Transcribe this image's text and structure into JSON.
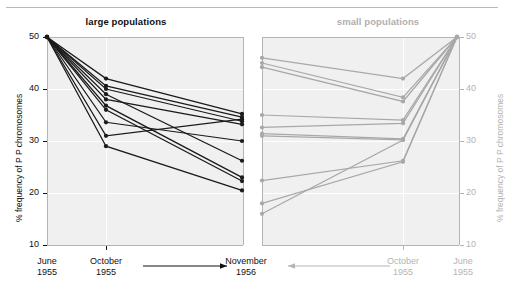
{
  "figure": {
    "y_axis_label": "% frequency of P P chromosomes",
    "y_ticks": [
      "50",
      "40",
      "30",
      "20",
      "10"
    ],
    "y_tick_values": [
      50,
      40,
      30,
      20,
      10
    ],
    "colors": {
      "large_series": "#1a1a1a",
      "small_series": "#a8a8a8",
      "plot_background": "#f0f0f0",
      "gridline": "#ffffff",
      "axis": "#b4b4b4",
      "dark_text": "#111111",
      "gray_text": "#b4b4b4"
    }
  },
  "panels": [
    {
      "id": "large",
      "title": "large populations",
      "x_labels": [
        {
          "line1": "June",
          "line2": "1955"
        },
        {
          "line1": "October",
          "line2": "1955"
        },
        {
          "line1": "November",
          "line2": "1956"
        }
      ],
      "arrow_direction": "right"
    },
    {
      "id": "small",
      "title": "small populations",
      "x_labels": [
        {
          "line1": "November",
          "line2": "1956"
        },
        {
          "line1": "October",
          "line2": "1955"
        },
        {
          "line1": "June",
          "line2": "1955"
        }
      ],
      "arrow_direction": "left"
    }
  ],
  "chart_data": {
    "type": "line",
    "xlabel": "",
    "ylabel": "% frequency of P P chromosomes",
    "ylim": [
      10,
      50
    ],
    "grid": true,
    "legend": "none",
    "panels": [
      {
        "name": "large populations",
        "color": "#1a1a1a",
        "categories": [
          "June 1955",
          "October 1955",
          "November 1956"
        ],
        "series": [
          {
            "name": "large-1",
            "values": [
              50,
              42.0,
              35.2
            ]
          },
          {
            "name": "large-2",
            "values": [
              50,
              40.6,
              34.6
            ]
          },
          {
            "name": "large-3",
            "values": [
              50,
              40.0,
              33.8
            ]
          },
          {
            "name": "large-4",
            "values": [
              50,
              39.0,
              26.2
            ]
          },
          {
            "name": "large-5",
            "values": [
              50,
              38.0,
              33.2
            ]
          },
          {
            "name": "large-6",
            "values": [
              50,
              36.8,
              23.0
            ]
          },
          {
            "name": "large-7",
            "values": [
              50,
              36.0,
              22.3
            ]
          },
          {
            "name": "large-8",
            "values": [
              50,
              33.6,
              30.0
            ]
          },
          {
            "name": "large-9",
            "values": [
              50,
              31.0,
              34.2
            ]
          },
          {
            "name": "large-10",
            "values": [
              50,
              29.0,
              20.5
            ]
          }
        ]
      },
      {
        "name": "small populations",
        "color": "#a8a8a8",
        "categories": [
          "June 1955",
          "October 1955",
          "November 1956"
        ],
        "series": [
          {
            "name": "small-1",
            "values": [
              50,
              42.0,
              46.0
            ]
          },
          {
            "name": "small-2",
            "values": [
              50,
              38.4,
              45.0
            ]
          },
          {
            "name": "small-3",
            "values": [
              50,
              37.6,
              44.2
            ]
          },
          {
            "name": "small-4",
            "values": [
              50,
              34.0,
              35.0
            ]
          },
          {
            "name": "small-5",
            "values": [
              50,
              33.4,
              32.6
            ]
          },
          {
            "name": "small-6",
            "values": [
              50,
              30.4,
              31.4
            ]
          },
          {
            "name": "small-7",
            "values": [
              50,
              30.2,
              31.0
            ]
          },
          {
            "name": "small-8",
            "values": [
              50,
              26.2,
              22.4
            ]
          },
          {
            "name": "small-9",
            "values": [
              50,
              26.0,
              18.0
            ]
          },
          {
            "name": "small-10",
            "values": [
              50,
              30.2,
              16.0
            ]
          }
        ]
      }
    ]
  }
}
